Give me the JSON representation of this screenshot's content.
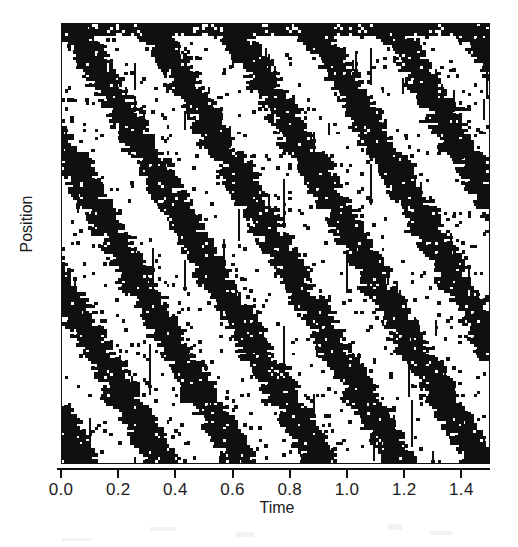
{
  "figure": {
    "kind": "spatiotemporal-raster-plot",
    "background_color": "#ffffff",
    "ink_color": "#101010",
    "frame_color": "#101010"
  },
  "axes": {
    "x_title": "Time",
    "y_title": "Position",
    "x_tick_labels": [
      "0.0",
      "0.2",
      "0.4",
      "0.6",
      "0.8",
      "1.0",
      "1.2",
      "1.4"
    ],
    "y_tick_labels": []
  },
  "chart_data": {
    "type": "heatmap",
    "title": "",
    "subtitle": "",
    "xlabel": "Time",
    "ylabel": "Position",
    "xlim": [
      0.0,
      1.5
    ],
    "ylim": [
      0.0,
      1.0
    ],
    "x_ticks": [
      0.0,
      0.2,
      0.4,
      0.6,
      0.8,
      1.0,
      1.2,
      1.4
    ],
    "x_tick_labels": [
      "0.0",
      "0.2",
      "0.4",
      "0.6",
      "0.8",
      "1.0",
      "1.2",
      "1.4"
    ],
    "y_ticks": [],
    "y_tick_labels": [],
    "grid": false,
    "legend": false,
    "legend_position": "none",
    "colormap": [
      "#ffffff",
      "#101010"
    ],
    "value_range": [
      0,
      1
    ],
    "pattern": {
      "band_period_time": 0.28,
      "band_count_visible": 6,
      "band_slope_position_per_time": -1.15,
      "band_duty_cycle": 0.45,
      "speckle_density": 0.055,
      "edge_roughness": 0.35,
      "seed": 20240517
    },
    "annotations": []
  },
  "artifacts": {
    "scan_marks": [
      {
        "x": 150,
        "y": 527,
        "w": 26,
        "h": 4
      },
      {
        "x": 236,
        "y": 532,
        "w": 18,
        "h": 5
      },
      {
        "x": 388,
        "y": 524,
        "w": 14,
        "h": 6
      },
      {
        "x": 430,
        "y": 531,
        "w": 22,
        "h": 4
      },
      {
        "x": 62,
        "y": 538,
        "w": 30,
        "h": 3
      }
    ]
  }
}
